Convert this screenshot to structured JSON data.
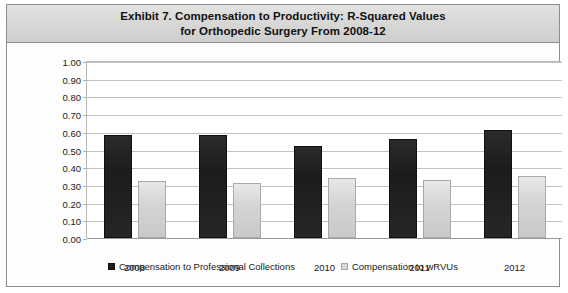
{
  "figure": {
    "title_line_1": "Exhibit 7. Compensation to Productivity: R-Squared Values",
    "title_line_2": "for Orthopedic Surgery From 2008-12",
    "border_color": "#8d8d8d",
    "title_bar_color": "#d8d8d6"
  },
  "chart_data": {
    "type": "bar",
    "title": "Exhibit 7. Compensation to Productivity: R-Squared Values for Orthopedic Surgery From 2008-12",
    "xlabel": "",
    "ylabel": "",
    "categories": [
      "2008",
      "2009",
      "2010",
      "2011",
      "2012"
    ],
    "series": [
      {
        "name": "Compensation to Professional Collections",
        "color": "#1f1f1f",
        "values": [
          0.58,
          0.58,
          0.52,
          0.56,
          0.61
        ]
      },
      {
        "name": "Compensation to wRVUs",
        "color": "#d7d7d7",
        "values": [
          0.32,
          0.31,
          0.34,
          0.33,
          0.35
        ]
      }
    ],
    "ylim": [
      0.0,
      1.0
    ],
    "ytick_step": 0.1,
    "yticks": [
      "0.00",
      "0.10",
      "0.20",
      "0.30",
      "0.40",
      "0.50",
      "0.60",
      "0.70",
      "0.80",
      "0.90",
      "1.00"
    ],
    "grid": true,
    "legend_position": "bottom"
  }
}
